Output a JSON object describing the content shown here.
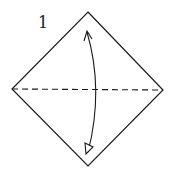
{
  "diagram": {
    "type": "origami-fold-step",
    "step_number": "1",
    "shape": "square-diamond",
    "fold_line": "valley-fold-horizontal",
    "arrow": "fold-and-unfold",
    "colors": {
      "stroke": "#1a1a1a",
      "background": "#ffffff"
    }
  }
}
